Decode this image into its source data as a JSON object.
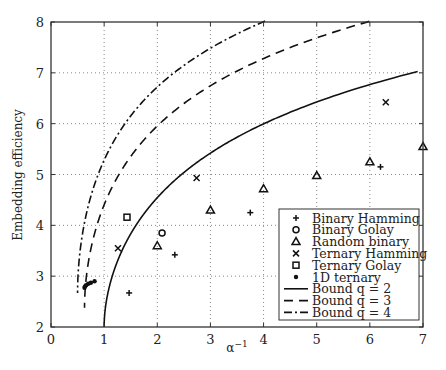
{
  "chart_data": {
    "type": "scatter",
    "title": "",
    "xlabel": "α⁻¹",
    "ylabel": "Embedding efficiency",
    "xlim": [
      0,
      7
    ],
    "ylim": [
      2,
      8
    ],
    "xticks": [
      0,
      1,
      2,
      3,
      4,
      5,
      6,
      7
    ],
    "yticks": [
      2,
      3,
      4,
      5,
      6,
      7,
      8
    ],
    "grid": true,
    "legend_position": "lower right",
    "series": [
      {
        "name": "Binary Hamming",
        "marker": "plus",
        "points": [
          [
            1.47,
            2.67
          ],
          [
            2.33,
            3.42
          ],
          [
            3.75,
            4.25
          ],
          [
            6.2,
            5.15
          ]
        ]
      },
      {
        "name": "Binary Golay",
        "marker": "circle",
        "points": [
          [
            2.09,
            3.85
          ]
        ]
      },
      {
        "name": "Random binary",
        "marker": "triangle",
        "points": [
          [
            2,
            3.6
          ],
          [
            3,
            4.3
          ],
          [
            4,
            4.72
          ],
          [
            5,
            4.98
          ],
          [
            6,
            5.25
          ],
          [
            7,
            5.55
          ]
        ]
      },
      {
        "name": "Ternary Hamming",
        "marker": "x",
        "points": [
          [
            1.26,
            3.55
          ],
          [
            2.74,
            4.93
          ],
          [
            6.3,
            6.42
          ]
        ]
      },
      {
        "name": "Ternary Golay",
        "marker": "square",
        "points": [
          [
            1.43,
            4.16
          ]
        ]
      },
      {
        "name": "1D ternary",
        "marker": "dot",
        "points": [
          [
            0.63,
            2.77
          ],
          [
            0.66,
            2.82
          ],
          [
            0.7,
            2.85
          ],
          [
            0.75,
            2.87
          ],
          [
            0.82,
            2.9
          ],
          [
            0.64,
            2.8
          ]
        ]
      },
      {
        "name": "Bound q = 2",
        "line": "solid",
        "q": 2
      },
      {
        "name": "Bound q = 3",
        "line": "dashed",
        "q": 3
      },
      {
        "name": "Bound q = 4",
        "line": "dashdot",
        "q": 4
      }
    ]
  },
  "legend": {
    "items": [
      {
        "label": "Binary Hamming",
        "sym": "plus"
      },
      {
        "label": "Binary Golay",
        "sym": "circle"
      },
      {
        "label": "Random binary",
        "sym": "triangle"
      },
      {
        "label": "Ternary Hamming",
        "sym": "x"
      },
      {
        "label": "Ternary Golay",
        "sym": "square"
      },
      {
        "label": "1D ternary",
        "sym": "dot"
      },
      {
        "label": "Bound q = 2",
        "sym": "solid"
      },
      {
        "label": "Bound q = 3",
        "sym": "dashed"
      },
      {
        "label": "Bound q = 4",
        "sym": "dashdot"
      }
    ]
  }
}
